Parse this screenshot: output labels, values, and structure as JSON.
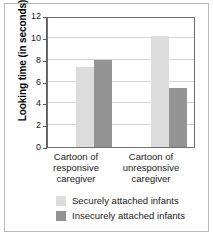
{
  "chart_data": {
    "type": "bar",
    "title": "",
    "subtitle": "",
    "xlabel": "",
    "ylabel": "Looking time (in seconds)",
    "categories": [
      "Cartoon of responsive caregiver",
      "Cartoon of unresponsive caregiver"
    ],
    "category_lines": [
      [
        "Cartoon of",
        "responsive",
        "caregiver"
      ],
      [
        "Cartoon of",
        "unresponsive",
        "caregiver"
      ]
    ],
    "series": [
      {
        "name": "Securely attached infants",
        "color": "#dcdcdc",
        "values": [
          7.3,
          10.2
        ]
      },
      {
        "name": "Insecurely attached infants",
        "color": "#949494",
        "values": [
          8.0,
          5.4
        ]
      }
    ],
    "ylim": [
      0,
      12
    ],
    "ytick_values": [
      0,
      2,
      4,
      6,
      8,
      10,
      12
    ],
    "ytick_labels": [
      "0",
      "2",
      "4",
      "6",
      "8",
      "10",
      "12"
    ],
    "grid": true,
    "grid_axis": "y",
    "legend_position": "bottom",
    "axis_color": "#5a5a5a",
    "grid_color": "#d2d2d2",
    "frame_color": "#b8b8b8",
    "background": "#ffffff"
  }
}
